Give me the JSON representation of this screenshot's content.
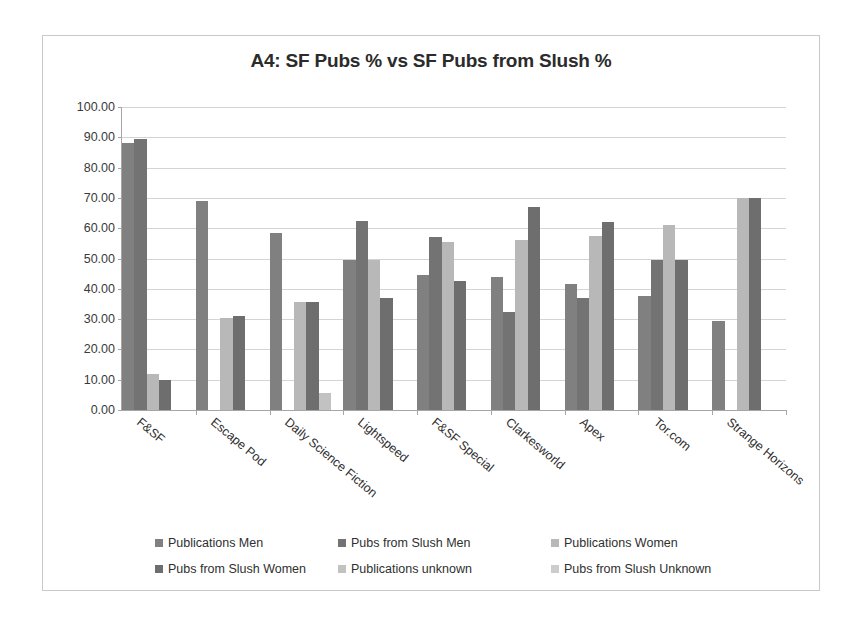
{
  "chart_data": {
    "type": "bar",
    "title": "A4: SF Pubs % vs SF Pubs from Slush %",
    "xlabel": "",
    "ylabel": "",
    "ylim": [
      0,
      100
    ],
    "ytick_step": 10,
    "ytick_labels": [
      "100.00",
      "90.00",
      "80.00",
      "70.00",
      "60.00",
      "50.00",
      "40.00",
      "30.00",
      "20.00",
      "10.00",
      "0.00"
    ],
    "grid": true,
    "legend_position": "bottom",
    "categories": [
      "F&SF",
      "Escape Pod",
      "Daily Science Fiction",
      "Lightspeed",
      "F&SF Special",
      "Clarkesworld",
      "Apex",
      "Tor.com",
      "Strange Horizons"
    ],
    "series": [
      {
        "name": "Publications Men",
        "color": "#808080",
        "values": [
          88.0,
          69.0,
          58.5,
          49.5,
          44.5,
          44.0,
          41.5,
          37.5,
          29.5
        ]
      },
      {
        "name": "Pubs from Slush Men",
        "color": "#737373",
        "values": [
          89.5,
          0.0,
          0.0,
          62.5,
          57.0,
          32.5,
          37.0,
          49.5,
          0.0
        ]
      },
      {
        "name": "Publications Women",
        "color": "#b8b8b8",
        "values": [
          12.0,
          30.5,
          35.5,
          49.5,
          55.5,
          56.0,
          57.5,
          61.0,
          70.0
        ]
      },
      {
        "name": "Pubs from Slush Women",
        "color": "#6e6e6e",
        "values": [
          10.0,
          31.0,
          35.5,
          37.0,
          42.5,
          67.0,
          62.0,
          49.5,
          70.0
        ]
      },
      {
        "name": "Publications unknown",
        "color": "#c2c2c2",
        "values": [
          0.0,
          0.0,
          5.5,
          0.0,
          0.0,
          0.0,
          0.0,
          0.0,
          0.0
        ]
      },
      {
        "name": "Pubs from Slush Unknown",
        "color": "#cccccc",
        "values": [
          0.0,
          0.0,
          0.0,
          0.0,
          0.0,
          0.0,
          0.0,
          0.0,
          0.0
        ]
      }
    ]
  }
}
